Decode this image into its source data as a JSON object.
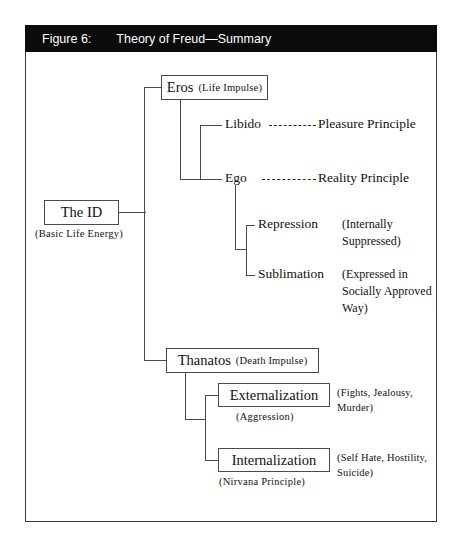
{
  "figure": {
    "label": "Figure 6:",
    "title": "Theory of Freud—Summary"
  },
  "nodes": {
    "id": {
      "main": "The ID",
      "caption": "(Basic Life Energy)"
    },
    "eros": {
      "main": "Eros",
      "paren": "(Life Impulse)"
    },
    "libido": {
      "main": "Libido",
      "linked": "Pleasure Principle"
    },
    "ego": {
      "main": "Ego",
      "linked": "Reality Principle"
    },
    "repression": {
      "main": "Repression",
      "note": "(Internally\nSuppressed)"
    },
    "sublimation": {
      "main": "Sublimation",
      "note": "(Expressed in\nSocially Approved\nWay)"
    },
    "thanatos": {
      "main": "Thanatos",
      "paren": "(Death Impulse)"
    },
    "externalization": {
      "main": "Externalization",
      "caption": "(Aggression)",
      "note": "(Fights, Jealousy,\nMurder)"
    },
    "internalization": {
      "main": "Internalization",
      "caption": "(Nirvana Principle)",
      "note": "(Self Hate, Hostility,\nSuicide)"
    }
  },
  "colors": {
    "title_bar_bg": "#0b0b0b",
    "title_bar_text": "#ffffff",
    "frame_border": "#3a3a3a",
    "line": "#4a4a4a",
    "text": "#111111",
    "page_bg": "#ffffff"
  }
}
